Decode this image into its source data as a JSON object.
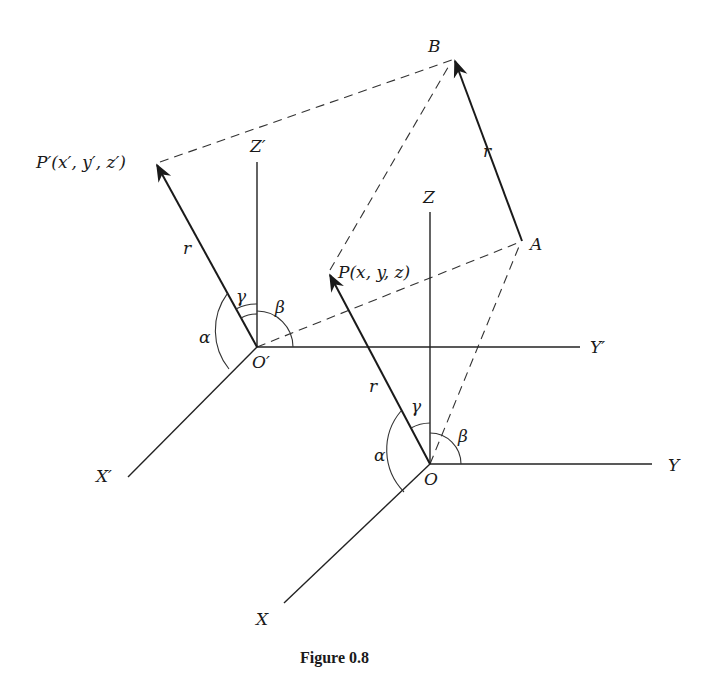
{
  "figure": {
    "caption": "Figure 0.8",
    "colors": {
      "ink": "#1a1a1a",
      "background": "#ffffff"
    }
  },
  "frames": {
    "primed": {
      "origin_label": "O′",
      "x_label": "X′",
      "y_label": "Y′",
      "z_label": "Z′"
    },
    "unprimed": {
      "origin_label": "O",
      "x_label": "X",
      "y_label": "Y",
      "z_label": "Z"
    }
  },
  "points": {
    "p_prime": "P′(x′, y′, z′)",
    "p": "P(x, y, z)",
    "a": "A",
    "b": "B"
  },
  "vectors": {
    "r_primed": "r",
    "r_unprimed": "r",
    "r_ab": "r"
  },
  "angles": {
    "primed": {
      "alpha": "α",
      "beta": "β",
      "gamma": "γ"
    },
    "unprimed": {
      "alpha": "α",
      "beta": "β",
      "gamma": "γ"
    }
  }
}
